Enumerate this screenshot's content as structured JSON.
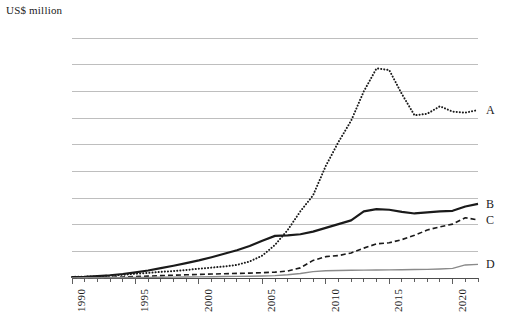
{
  "chart_data": {
    "type": "line",
    "title": "",
    "ylabel": "US$ million",
    "xlabel": "",
    "ylim": [
      0,
      4500000
    ],
    "xlim": [
      1990,
      2022
    ],
    "grid": true,
    "legend_position": "right-inline",
    "y_ticks": [
      0,
      500000,
      1000000,
      1500000,
      2000000,
      2500000,
      3000000,
      3500000,
      4000000,
      4500000
    ],
    "y_tick_labels": [
      "0",
      "500,000",
      "1,000,000",
      "1,500,000",
      "2,000,000",
      "2,500,000",
      "3,000,000",
      "3,500,000",
      "4,000,000",
      "4,500,000"
    ],
    "x_ticks": [
      1990,
      1995,
      2000,
      2005,
      2010,
      2015,
      2020
    ],
    "x_tick_labels": [
      "1990",
      "1995",
      "2000",
      "2005",
      "2010",
      "2015",
      "2020"
    ],
    "x_minor_tick_interval": 1,
    "x": [
      1990,
      1991,
      1992,
      1993,
      1994,
      1995,
      1996,
      1997,
      1998,
      1999,
      2000,
      2001,
      2002,
      2003,
      2004,
      2005,
      2006,
      2007,
      2008,
      2009,
      2010,
      2011,
      2012,
      2013,
      2014,
      2015,
      2016,
      2017,
      2018,
      2019,
      2020,
      2021,
      2022
    ],
    "series": [
      {
        "name": "A",
        "style": "dotted",
        "color": "#1a1a1a",
        "width": 2,
        "values": [
          20000,
          25000,
          32000,
          45000,
          60000,
          80000,
          95000,
          115000,
          130000,
          150000,
          175000,
          195000,
          215000,
          245000,
          310000,
          420000,
          620000,
          900000,
          1250000,
          1550000,
          2100000,
          2550000,
          2950000,
          3500000,
          3930000,
          3900000,
          3450000,
          3050000,
          3080000,
          3220000,
          3120000,
          3100000,
          3150000
        ]
      },
      {
        "name": "B",
        "style": "solid",
        "color": "#1a1a1a",
        "width": 2.2,
        "values": [
          15000,
          22000,
          35000,
          52000,
          75000,
          105000,
          140000,
          185000,
          230000,
          280000,
          330000,
          390000,
          455000,
          520000,
          600000,
          700000,
          790000,
          800000,
          820000,
          870000,
          940000,
          1010000,
          1080000,
          1250000,
          1290000,
          1280000,
          1240000,
          1210000,
          1230000,
          1250000,
          1260000,
          1340000,
          1390000
        ]
      },
      {
        "name": "C",
        "style": "dashed",
        "color": "#1a1a1a",
        "width": 1.6,
        "values": [
          5000,
          7000,
          10000,
          14000,
          20000,
          28000,
          36000,
          45000,
          52000,
          60000,
          68000,
          74000,
          80000,
          86000,
          92000,
          100000,
          110000,
          130000,
          190000,
          330000,
          400000,
          420000,
          470000,
          560000,
          640000,
          660000,
          720000,
          800000,
          900000,
          960000,
          1010000,
          1130000,
          1090000
        ]
      },
      {
        "name": "D",
        "style": "solid-thin",
        "color": "#8a8a8a",
        "width": 1.4,
        "values": [
          3000,
          4000,
          5000,
          6500,
          8000,
          10000,
          12000,
          14000,
          16000,
          18000,
          21000,
          24000,
          27000,
          30000,
          34000,
          38000,
          45000,
          60000,
          85000,
          120000,
          135000,
          140000,
          145000,
          148000,
          150000,
          152000,
          155000,
          158000,
          162000,
          170000,
          180000,
          245000,
          255000
        ]
      }
    ],
    "series_labels": [
      {
        "label": "A",
        "value": 3150000
      },
      {
        "label": "B",
        "value": 1390000
      },
      {
        "label": "C",
        "value": 1090000
      },
      {
        "label": "D",
        "value": 255000
      }
    ]
  },
  "colors": {
    "gridline": "#b7b7b7",
    "axis": "#4d4d4d",
    "text": "#1a1a1a",
    "series_gray": "#8a8a8a"
  }
}
